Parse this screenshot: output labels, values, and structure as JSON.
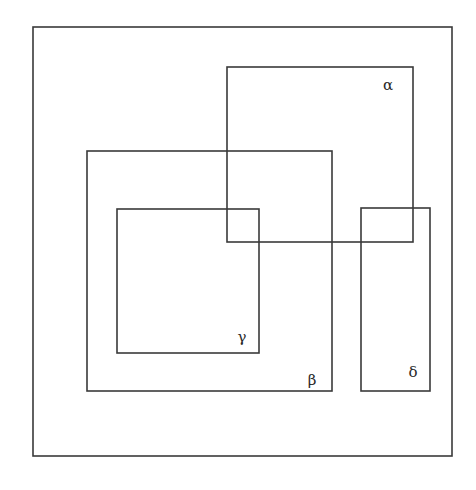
{
  "diagram": {
    "type": "venn-rectangles",
    "canvas": {
      "width": 476,
      "height": 490,
      "background": "#ffffff"
    },
    "stroke_color": "#3a3a3a",
    "universe": {
      "name": "universal-set",
      "label": "",
      "x": 33,
      "y": 27,
      "width": 419,
      "height": 429
    },
    "sets": [
      {
        "id": "alpha",
        "label": "α",
        "x": 227,
        "y": 67,
        "width": 186,
        "height": 175,
        "label_x": 388,
        "label_y": 90
      },
      {
        "id": "beta",
        "label": "β",
        "x": 87,
        "y": 151,
        "width": 245,
        "height": 240,
        "label_x": 312,
        "label_y": 385
      },
      {
        "id": "gamma",
        "label": "γ",
        "x": 117,
        "y": 209,
        "width": 142,
        "height": 144,
        "label_x": 242,
        "label_y": 342
      },
      {
        "id": "delta",
        "label": "δ",
        "x": 361,
        "y": 208,
        "width": 69,
        "height": 183,
        "label_x": 413,
        "label_y": 377
      }
    ]
  }
}
